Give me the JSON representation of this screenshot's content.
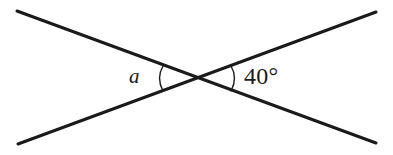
{
  "figure": {
    "kind": "geometry-diagram",
    "background_color": "#ffffff",
    "stroke_color": "#1a1a1a",
    "line_width_px": 3,
    "arc_stroke_color": "#1a1a1a",
    "arc_line_width_px": 1.4,
    "canvas": {
      "width": 393,
      "height": 155
    },
    "intersection_point": {
      "x": 198,
      "y": 78
    },
    "lines": [
      {
        "name": "line-top-left-to-bottom-right",
        "from": {
          "x": 17,
          "y": 11
        },
        "to": {
          "x": 376,
          "y": 143
        }
      },
      {
        "name": "line-bottom-left-to-top-right",
        "from": {
          "x": 18,
          "y": 144
        },
        "to": {
          "x": 376,
          "y": 12
        }
      }
    ],
    "arcs": [
      {
        "name": "angle-arc-left",
        "start": {
          "x": 163,
          "y": 66
        },
        "control": {
          "x": 156,
          "y": 78
        },
        "end": {
          "x": 163,
          "y": 91
        }
      },
      {
        "name": "angle-arc-right",
        "start": {
          "x": 231,
          "y": 66
        },
        "control": {
          "x": 238,
          "y": 78
        },
        "end": {
          "x": 231,
          "y": 91
        }
      }
    ]
  },
  "labels": {
    "left_angle": "a",
    "right_angle": "40°"
  }
}
